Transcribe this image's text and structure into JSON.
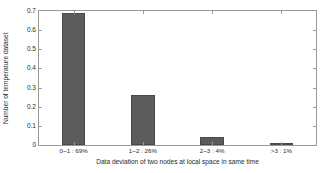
{
  "chart_data": {
    "type": "bar",
    "title": "",
    "xlabel": "Data deviation of two nodes at local space in same time",
    "ylabel": "Number of temperature dataset",
    "categories": [
      "0~1 : 69%",
      "1~2 : 26%",
      "2~3 : 4%",
      ">3 : 1%"
    ],
    "values": [
      0.69,
      0.26,
      0.04,
      0.01
    ],
    "ylim": [
      0,
      0.7
    ],
    "xlim": [
      0,
      4
    ],
    "yticks": [
      "0",
      "0.1",
      "0.2",
      "0.3",
      "0.4",
      "0.5",
      "0.6",
      "0.7"
    ],
    "ytick_values": [
      0,
      0.1,
      0.2,
      0.3,
      0.4,
      0.5,
      0.6,
      0.7
    ],
    "grid": false,
    "legend": "none",
    "bar_color": "#5c5c5c",
    "bar_edge_color": "#4a4a4a",
    "axis_color": "#9a9a9a",
    "background_color": "#ffffff",
    "bar_width_fraction": 0.34
  }
}
